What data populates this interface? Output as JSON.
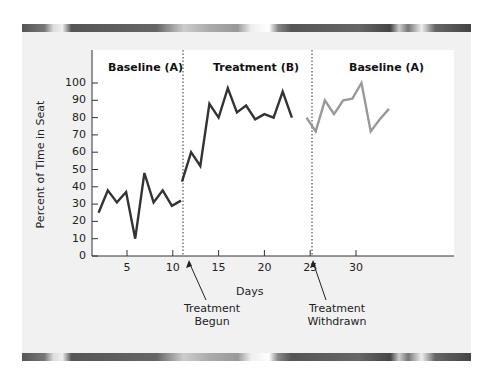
{
  "phases": {
    "baseline1": "Baseline (A)",
    "treatment": "Treatment (B)",
    "baseline2": "Baseline (A)"
  },
  "axes": {
    "ylabel": "Percent of Time in Seat",
    "xlabel": "Days",
    "yticks": [
      "100",
      "90",
      "80",
      "70",
      "60",
      "50",
      "40",
      "30",
      "20",
      "10",
      "0"
    ],
    "xticks": [
      "5",
      "10",
      "15",
      "20",
      "25",
      "30"
    ]
  },
  "annotations": {
    "begun_line1": "Treatment",
    "begun_line2": "Begun",
    "withdrawn_line1": "Treatment",
    "withdrawn_line2": "Withdrawn"
  },
  "colors": {
    "baseline1": "#333333",
    "treatment": "#333333",
    "baseline2": "#999999"
  },
  "chart_data": {
    "type": "line",
    "title": "",
    "xlabel": "Days",
    "ylabel": "Percent of Time in Seat",
    "ylim": [
      0,
      100
    ],
    "xlim": [
      1,
      35
    ],
    "grid": false,
    "phase_labels": [
      "Baseline (A)",
      "Treatment (B)",
      "Baseline (A)"
    ],
    "phase_boundaries": [
      10.5,
      23.5
    ],
    "annotations": [
      "Treatment Begun",
      "Treatment Withdrawn"
    ],
    "series": [
      {
        "name": "Baseline (A)",
        "x": [
          1,
          2,
          3,
          4,
          5,
          6,
          7,
          8,
          9,
          10
        ],
        "values": [
          25,
          38,
          31,
          37,
          10,
          48,
          31,
          38,
          29,
          32
        ]
      },
      {
        "name": "Treatment (B)",
        "x": [
          11,
          12,
          13,
          14,
          15,
          16,
          17,
          18,
          19,
          20,
          21,
          22,
          23
        ],
        "values": [
          43,
          60,
          52,
          88,
          80,
          97,
          83,
          87,
          79,
          82,
          80,
          95,
          80
        ]
      },
      {
        "name": "Baseline (A) return",
        "x": [
          24,
          25,
          26,
          27,
          28,
          29,
          30,
          31,
          32,
          33
        ],
        "values": [
          80,
          72,
          90,
          82,
          90,
          91,
          100,
          72,
          79,
          85
        ]
      }
    ]
  }
}
